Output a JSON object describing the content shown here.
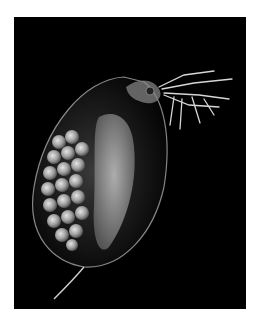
{
  "image": {
    "subject": "Daphnia (water flea) carrying eggs, dark-field micrograph",
    "background_color": "#000000",
    "page_background": "#ffffff",
    "alt": "Water flea with brood pouch full of eggs on black background"
  },
  "captions": {
    "top": "",
    "bottom": ""
  }
}
